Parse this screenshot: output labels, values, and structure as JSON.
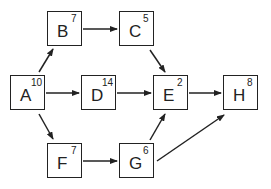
{
  "diagram": {
    "type": "directed-graph",
    "nodes": [
      {
        "id": "A",
        "label": "A",
        "weight": "10",
        "x": 10,
        "y": 75
      },
      {
        "id": "B",
        "label": "B",
        "weight": "7",
        "x": 47,
        "y": 11
      },
      {
        "id": "C",
        "label": "C",
        "weight": "5",
        "x": 119,
        "y": 11
      },
      {
        "id": "D",
        "label": "D",
        "weight": "14",
        "x": 81,
        "y": 75
      },
      {
        "id": "E",
        "label": "E",
        "weight": "2",
        "x": 153,
        "y": 75
      },
      {
        "id": "F",
        "label": "F",
        "weight": "7",
        "x": 47,
        "y": 143
      },
      {
        "id": "G",
        "label": "G",
        "weight": "6",
        "x": 119,
        "y": 143
      },
      {
        "id": "H",
        "label": "H",
        "weight": "8",
        "x": 223,
        "y": 75
      }
    ],
    "edges": [
      {
        "from": "A",
        "to": "B",
        "x1": 39,
        "y1": 72,
        "x2": 53,
        "y2": 49
      },
      {
        "from": "A",
        "to": "D",
        "x1": 46,
        "y1": 93,
        "x2": 79,
        "y2": 93
      },
      {
        "from": "A",
        "to": "F",
        "x1": 39,
        "y1": 114,
        "x2": 53,
        "y2": 139
      },
      {
        "from": "B",
        "to": "C",
        "x1": 83,
        "y1": 29,
        "x2": 117,
        "y2": 29
      },
      {
        "from": "C",
        "to": "E",
        "x1": 150,
        "y1": 50,
        "x2": 165,
        "y2": 72
      },
      {
        "from": "D",
        "to": "E",
        "x1": 117,
        "y1": 93,
        "x2": 151,
        "y2": 93
      },
      {
        "from": "E",
        "to": "H",
        "x1": 189,
        "y1": 93,
        "x2": 221,
        "y2": 93
      },
      {
        "from": "F",
        "to": "G",
        "x1": 83,
        "y1": 161,
        "x2": 117,
        "y2": 161
      },
      {
        "from": "G",
        "to": "E",
        "x1": 150,
        "y1": 140,
        "x2": 165,
        "y2": 114
      },
      {
        "from": "G",
        "to": "H",
        "x1": 157,
        "y1": 161,
        "x2": 224,
        "y2": 115
      }
    ],
    "colors": {
      "stroke": "#222222",
      "background": "#ffffff"
    }
  }
}
